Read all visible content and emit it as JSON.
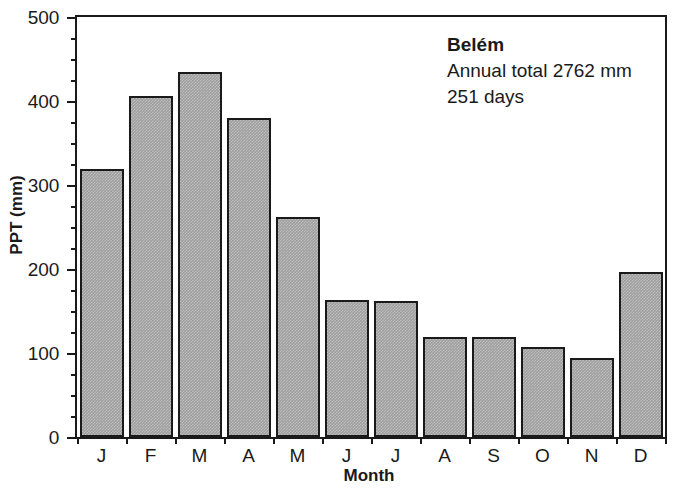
{
  "chart_data": {
    "type": "bar",
    "title": "",
    "categories": [
      "J",
      "F",
      "M",
      "A",
      "M",
      "J",
      "J",
      "A",
      "S",
      "O",
      "N",
      "D"
    ],
    "category_names": [
      "January",
      "February",
      "March",
      "April",
      "May",
      "June",
      "July",
      "August",
      "September",
      "October",
      "November",
      "December"
    ],
    "values": [
      319,
      406,
      434,
      380,
      262,
      163,
      162,
      119,
      119,
      107,
      94,
      196
    ],
    "xlabel": "Month",
    "ylabel": "PPT (mm)",
    "ylim": [
      0,
      500
    ],
    "ytick_values": [
      0,
      100,
      200,
      300,
      400,
      500
    ],
    "ytick_labels": [
      "0",
      "100",
      "200",
      "300",
      "400",
      "500"
    ],
    "yminor_interval": 25,
    "grid": false,
    "legend": null,
    "annotations": {
      "site": "Belém",
      "annual_total": "Annual total 2762 mm",
      "rain_days": "251 days"
    },
    "series_color": "#9e9e9e",
    "outline_color": "#1a1a1a"
  }
}
